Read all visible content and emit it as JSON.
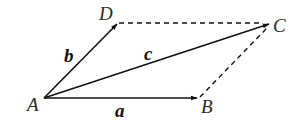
{
  "diagram": {
    "type": "parallelogram-vectors",
    "colors": {
      "stroke": "#111111",
      "label": "#2a2a2a",
      "background": "#ffffff"
    },
    "points": [
      {
        "id": "A",
        "label": "A",
        "x": 44,
        "y": 98
      },
      {
        "id": "B",
        "label": "B",
        "x": 198,
        "y": 98
      },
      {
        "id": "C",
        "label": "C",
        "x": 270,
        "y": 24
      },
      {
        "id": "D",
        "label": "D",
        "x": 117,
        "y": 23
      }
    ],
    "vectors": [
      {
        "id": "a",
        "label": "a",
        "from": "A",
        "to": "B",
        "style": "solid-arrow"
      },
      {
        "id": "b",
        "label": "b",
        "from": "A",
        "to": "D",
        "style": "solid-arrow"
      },
      {
        "id": "c",
        "label": "c",
        "from": "A",
        "to": "C",
        "style": "solid-arrow"
      }
    ],
    "segments": [
      {
        "from": "D",
        "to": "C",
        "style": "dashed"
      },
      {
        "from": "B",
        "to": "C",
        "style": "dashed"
      }
    ]
  }
}
